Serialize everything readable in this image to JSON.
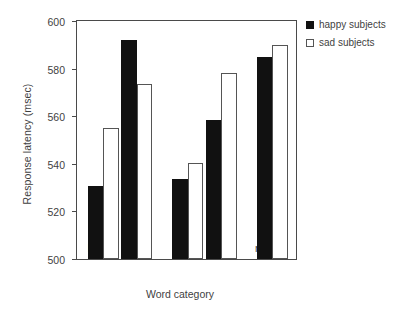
{
  "chart_data": {
    "type": "bar",
    "title": "",
    "xlabel": "Word category",
    "ylabel": "Response latency (msec)",
    "categories": [
      "happy",
      "sad",
      "pos",
      "neg",
      "neutral"
    ],
    "series": [
      {
        "name": "happy subjects",
        "values": [
          530.5,
          592,
          533.5,
          558.5,
          585
        ],
        "color": "#111111",
        "fill": "solid"
      },
      {
        "name": "sad subjects",
        "values": [
          555,
          573.5,
          540.5,
          578,
          590
        ],
        "color": "#ffffff",
        "fill": "open"
      }
    ],
    "ylim": [
      500,
      600
    ],
    "yticks": [
      500,
      520,
      540,
      560,
      580,
      600
    ],
    "ytick_labels": [
      "500",
      "520",
      "540",
      "560",
      "580",
      "600"
    ],
    "grid": false,
    "legend_position": "upper right outside",
    "group_gaps_after": [
      1,
      3
    ]
  },
  "legend": {
    "entries": [
      {
        "label": "happy subjects",
        "swatch": "filled-square-icon"
      },
      {
        "label": "sad subjects",
        "swatch": "open-square-icon"
      }
    ]
  }
}
